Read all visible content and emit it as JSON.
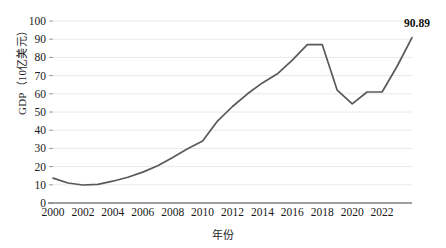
{
  "chart_data": {
    "type": "line",
    "title": "",
    "xlabel": "年份",
    "ylabel": "GDP（10亿美元）",
    "x": [
      2000,
      2001,
      2002,
      2003,
      2004,
      2005,
      2006,
      2007,
      2008,
      2009,
      2010,
      2011,
      2012,
      2013,
      2014,
      2015,
      2016,
      2017,
      2018,
      2019,
      2020,
      2021,
      2022,
      2023
    ],
    "values": [
      13.7,
      11.0,
      9.9,
      10.2,
      12.0,
      14.2,
      17.0,
      20.5,
      25.0,
      29.8,
      34.0,
      45.0,
      53.0,
      60.0,
      66.0,
      71.0,
      78.5,
      87.0,
      87.0,
      62.0,
      54.5,
      61.0,
      61.0,
      75.0
    ],
    "series": [
      {
        "name": "GDP",
        "values": [
          13.7,
          11.0,
          9.9,
          10.2,
          12.0,
          14.2,
          17.0,
          20.5,
          25.0,
          29.8,
          34.0,
          45.0,
          53.0,
          60.0,
          66.0,
          71.0,
          78.5,
          87.0,
          87.0,
          62.0,
          54.5,
          61.0,
          61.0,
          75.0
        ]
      }
    ],
    "last_point": {
      "x": 2024,
      "y": 90.89
    },
    "annotations": [
      {
        "text": "90.89",
        "x": 2024,
        "y": 90.89
      }
    ],
    "ylim": [
      0,
      100
    ],
    "xlim": [
      2000,
      2024
    ],
    "y_ticks": [
      "0",
      "10",
      "20",
      "30",
      "40",
      "50",
      "60",
      "70",
      "80",
      "90",
      "100"
    ],
    "x_ticks": [
      "2000",
      "2002",
      "2004",
      "2006",
      "2008",
      "2010",
      "2012",
      "2014",
      "2016",
      "2018",
      "2020",
      "2022"
    ],
    "grid": true,
    "legend": false,
    "line_color": "#59595b",
    "grid_color": "#e8e8ea",
    "axis_color": "#808080"
  }
}
